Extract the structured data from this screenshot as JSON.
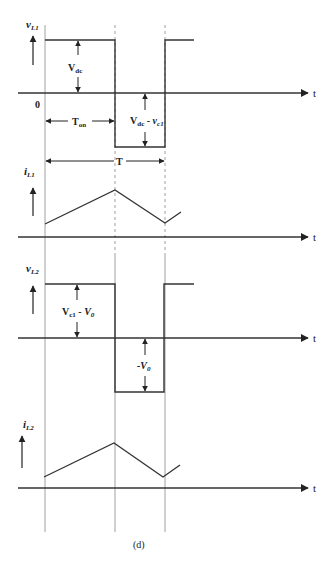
{
  "figure": {
    "caption": "(d)",
    "time_axis_label": "t",
    "origin_label": "0",
    "period_label": "T",
    "on_time_label": "T",
    "on_time_sub": "on"
  },
  "panels": [
    {
      "id": "vL1",
      "ylabel_main": "v",
      "ylabel_sub": "L1",
      "high_label_main": "V",
      "high_label_sub": "dc",
      "low_label_main": "V",
      "low_label_sub": "dc",
      "low_label_mid": " - ",
      "low_label_tail": "v",
      "low_label_tail_sub": "c1",
      "waveform": "square"
    },
    {
      "id": "iL1",
      "ylabel_main": "i",
      "ylabel_sub": "L1",
      "waveform": "triangle"
    },
    {
      "id": "vL2",
      "ylabel_main": "v",
      "ylabel_sub": "L2",
      "high_label_main": "V",
      "high_label_sub": "c1",
      "high_label_mid": " - ",
      "high_label_tail": "V",
      "high_label_tail_sub": "0",
      "low_label_main": "-V",
      "low_label_sub": "0",
      "waveform": "square"
    },
    {
      "id": "iL2",
      "ylabel_main": "i",
      "ylabel_sub": "L2",
      "waveform": "triangle"
    }
  ],
  "colors": {
    "stroke": "#333333",
    "guide": "#888888",
    "text": "#222222"
  }
}
